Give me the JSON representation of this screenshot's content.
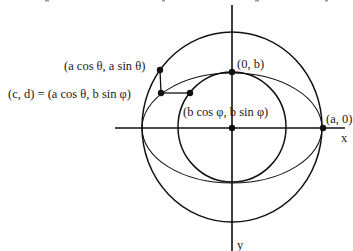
{
  "diagram": {
    "colors": {
      "ink": "#111111",
      "background": "#ffffff"
    },
    "geometry": {
      "center": [
        232,
        128
      ],
      "outer_circle_radius_x": 90,
      "outer_circle_radius_y": 95,
      "inner_circle_radius": 54,
      "ellipse_rx": 90,
      "ellipse_ry": 55
    },
    "labels": {
      "outer_point": "(a cos θ,  a sin θ)",
      "ellipse_point": "(c, d) = (a cos θ, b sin φ)",
      "inner_point": "(b cos φ,  b sin φ)",
      "top_point": "(0, b)",
      "right_point": "(a, 0)",
      "x_axis": "x",
      "y_axis": "y"
    }
  }
}
